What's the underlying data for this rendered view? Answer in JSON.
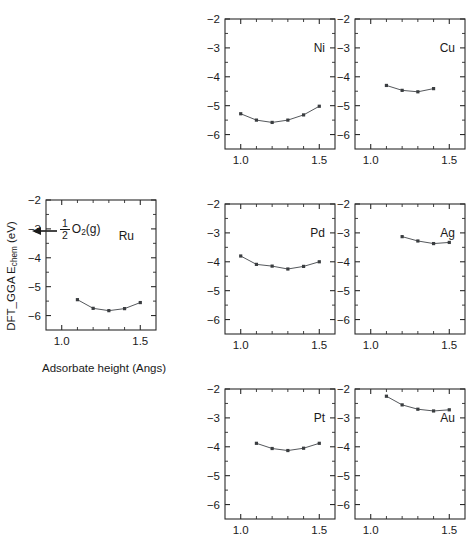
{
  "figure": {
    "axis_titles": {
      "x": "Adsorbate height (Angs)",
      "y_prefix": "DFT_GGA E",
      "y_sub": "chem",
      "y_suffix": " (eV)"
    },
    "annotation": {
      "name": "half-O2-gas-reference",
      "fraction_numerator": "1",
      "fraction_denominator": "2",
      "species": "O",
      "species_sub": "2",
      "species_state": "(g)",
      "arrow_points_to_eV": -2.9
    }
  },
  "chart_data": [
    {
      "id": "ru",
      "type": "line",
      "title": "Ru",
      "xlabel": "Adsorbate height (Angs)",
      "ylabel": "DFT_GGA E_chem (eV)",
      "xlim": [
        0.9,
        1.6
      ],
      "ylim": [
        -6.5,
        -2.0
      ],
      "xticks": [
        1.0,
        1.5
      ],
      "xticklabels": [
        "1.0",
        "1.5"
      ],
      "xminor": [
        1.1,
        1.2,
        1.3,
        1.4
      ],
      "yticks": [
        -2,
        -3,
        -4,
        -5,
        -6
      ],
      "yticklabels": [
        "-2",
        "-3",
        "-4",
        "-5",
        "-6"
      ],
      "grid": false,
      "legend": false,
      "x": [
        1.1,
        1.2,
        1.3,
        1.4,
        1.5
      ],
      "values": [
        -5.45,
        -5.75,
        -5.83,
        -5.76,
        -5.55
      ]
    },
    {
      "id": "ni",
      "type": "line",
      "title": "Ni",
      "xlim": [
        0.9,
        1.6
      ],
      "ylim": [
        -6.5,
        -2.0
      ],
      "xticks": [
        1.0,
        1.5
      ],
      "xticklabels": [
        "1.0",
        "1.5"
      ],
      "xminor": [
        1.1,
        1.2,
        1.3,
        1.4
      ],
      "yticks": [
        -2,
        -3,
        -4,
        -5,
        -6
      ],
      "yticklabels": [
        "-2",
        "-3",
        "-4",
        "-5",
        "-6"
      ],
      "grid": false,
      "legend": false,
      "x": [
        1.0,
        1.1,
        1.2,
        1.3,
        1.4,
        1.5
      ],
      "values": [
        -5.28,
        -5.5,
        -5.58,
        -5.5,
        -5.32,
        -5.02
      ]
    },
    {
      "id": "cu",
      "type": "line",
      "title": "Cu",
      "xlim": [
        0.9,
        1.6
      ],
      "ylim": [
        -6.5,
        -2.0
      ],
      "xticks": [
        1.0,
        1.5
      ],
      "xticklabels": [
        "1.0",
        "1.5"
      ],
      "xminor": [
        1.1,
        1.2,
        1.3,
        1.4
      ],
      "yticks": [
        -2,
        -3,
        -4,
        -5,
        -6
      ],
      "yticklabels": [
        "-2",
        "-3",
        "-4",
        "-5",
        "-6"
      ],
      "grid": false,
      "legend": false,
      "x": [
        1.1,
        1.2,
        1.3,
        1.4
      ],
      "values": [
        -4.3,
        -4.47,
        -4.52,
        -4.41
      ]
    },
    {
      "id": "pd",
      "type": "line",
      "title": "Pd",
      "xlim": [
        0.9,
        1.6
      ],
      "ylim": [
        -6.5,
        -2.0
      ],
      "xticks": [
        1.0,
        1.5
      ],
      "xticklabels": [
        "1.0",
        "1.5"
      ],
      "xminor": [
        1.1,
        1.2,
        1.3,
        1.4
      ],
      "yticks": [
        -2,
        -3,
        -4,
        -5,
        -6
      ],
      "yticklabels": [
        "-2",
        "-3",
        "-4",
        "-5",
        "-6"
      ],
      "grid": false,
      "legend": false,
      "x": [
        1.0,
        1.1,
        1.2,
        1.3,
        1.4,
        1.5
      ],
      "values": [
        -3.8,
        -4.09,
        -4.15,
        -4.25,
        -4.16,
        -4.0
      ]
    },
    {
      "id": "ag",
      "type": "line",
      "title": "Ag",
      "xlim": [
        0.9,
        1.6
      ],
      "ylim": [
        -6.5,
        -2.0
      ],
      "xticks": [
        1.0,
        1.5
      ],
      "xticklabels": [
        "1.0",
        "1.5"
      ],
      "xminor": [
        1.1,
        1.2,
        1.3,
        1.4
      ],
      "yticks": [
        -2,
        -3,
        -4,
        -5,
        -6
      ],
      "yticklabels": [
        "-2",
        "-3",
        "-4",
        "-5",
        "-6"
      ],
      "grid": false,
      "legend": false,
      "x": [
        1.2,
        1.3,
        1.4,
        1.5
      ],
      "values": [
        -3.13,
        -3.28,
        -3.37,
        -3.33
      ]
    },
    {
      "id": "pt",
      "type": "line",
      "title": "Pt",
      "xlim": [
        0.9,
        1.6
      ],
      "ylim": [
        -6.5,
        -2.0
      ],
      "xticks": [
        1.0,
        1.5
      ],
      "xticklabels": [
        "1.0",
        "1.5"
      ],
      "xminor": [
        1.1,
        1.2,
        1.3,
        1.4
      ],
      "yticks": [
        -2,
        -3,
        -4,
        -5,
        -6
      ],
      "yticklabels": [
        "-2",
        "-3",
        "-4",
        "-5",
        "-6"
      ],
      "grid": false,
      "legend": false,
      "x": [
        1.1,
        1.2,
        1.3,
        1.4,
        1.5
      ],
      "values": [
        -3.88,
        -4.06,
        -4.13,
        -4.05,
        -3.88
      ]
    },
    {
      "id": "au",
      "type": "line",
      "title": "Au",
      "xlim": [
        0.9,
        1.6
      ],
      "ylim": [
        -6.5,
        -2.0
      ],
      "xticks": [
        1.0,
        1.5
      ],
      "xticklabels": [
        "1.0",
        "1.5"
      ],
      "xminor": [
        1.1,
        1.2,
        1.3,
        1.4
      ],
      "yticks": [
        -2,
        -3,
        -4,
        -5,
        -6
      ],
      "yticklabels": [
        "-2",
        "-3",
        "-4",
        "-5",
        "-6"
      ],
      "grid": false,
      "legend": false,
      "x": [
        1.1,
        1.2,
        1.3,
        1.4,
        1.5
      ],
      "values": [
        -2.25,
        -2.55,
        -2.7,
        -2.76,
        -2.72
      ]
    }
  ],
  "panel_layout": [
    {
      "id": "ru",
      "left": 20,
      "top": 196,
      "show_xticklabels": true,
      "show_yticklabels": true,
      "label_pos": "mid-right"
    },
    {
      "id": "ni",
      "left": 199,
      "top": 15,
      "show_xticklabels": true,
      "show_yticklabels": true,
      "label_pos": "top-right"
    },
    {
      "id": "cu",
      "left": 329,
      "top": 15,
      "show_xticklabels": true,
      "show_yticklabels": true,
      "label_pos": "top-right"
    },
    {
      "id": "pd",
      "left": 199,
      "top": 200,
      "show_xticklabels": true,
      "show_yticklabels": true,
      "label_pos": "top-right"
    },
    {
      "id": "ag",
      "left": 329,
      "top": 200,
      "show_xticklabels": true,
      "show_yticklabels": true,
      "label_pos": "top-right"
    },
    {
      "id": "pt",
      "left": 199,
      "top": 385,
      "show_xticklabels": true,
      "show_yticklabels": true,
      "label_pos": "top-right"
    },
    {
      "id": "au",
      "left": 329,
      "top": 385,
      "show_xticklabels": true,
      "show_yticklabels": true,
      "label_pos": "mid-right"
    }
  ],
  "style": {
    "marker_color": "#3a3d40",
    "line_color": "#55585c",
    "axis_color": "#2b2b2b",
    "background": "#ffffff"
  }
}
